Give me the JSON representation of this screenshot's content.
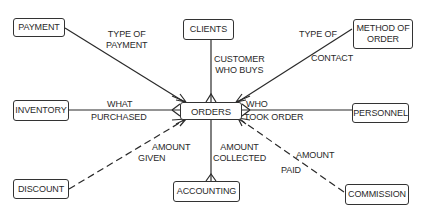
{
  "diagram": {
    "type": "entity-relationship",
    "center_entity": "ORDERS",
    "entities": {
      "payment": "PAYMENT",
      "clients": "CLIENTS",
      "method_of_order_line1": "METHOD OF",
      "method_of_order_line2": "ORDER",
      "inventory": "INVENTORY",
      "orders": "ORDERS",
      "personnel": "PERSONNEL",
      "discount": "DISCOUNT",
      "accounting": "ACCOUNTING",
      "commission": "COMMISSION"
    },
    "relationships": {
      "payment": {
        "line1": "TYPE OF",
        "line2": "PAYMENT",
        "style": "solid"
      },
      "clients": {
        "line1": "CUSTOMER",
        "line2": "WHO BUYS",
        "style": "solid"
      },
      "method_of_order": {
        "line1": "TYPE OF",
        "line2": "CONTACT",
        "style": "solid"
      },
      "inventory": {
        "line1": "WHAT",
        "line2": "PURCHASED",
        "style": "solid"
      },
      "personnel": {
        "line1": "WHO",
        "line2": "TOOK ORDER",
        "style": "solid"
      },
      "discount": {
        "line1": "AMOUNT",
        "line2": "GIVEN",
        "style": "dashed"
      },
      "accounting": {
        "line1": "AMOUNT",
        "line2": "COLLECTED",
        "style": "solid"
      },
      "commission": {
        "line1": "AMOUNT",
        "line2": "PAID",
        "style": "dashed"
      }
    }
  }
}
